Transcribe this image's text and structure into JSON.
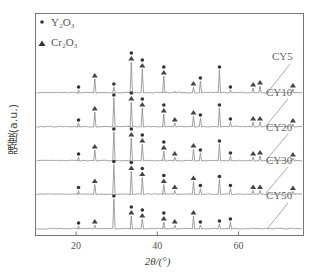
{
  "chart_data": {
    "type": "line",
    "title": "",
    "xlabel": "2θ/(°)",
    "ylabel": "强度(a.u.)",
    "xlim": [
      10,
      76
    ],
    "xticks": [
      20,
      40,
      60
    ],
    "grid": false,
    "legend": {
      "position": "top-left",
      "entries": [
        {
          "marker": "dot",
          "label": "Y2O3"
        },
        {
          "marker": "triangle",
          "label": "Cr2O3"
        }
      ]
    },
    "series": [
      {
        "name": "CY5",
        "peaks": [
          {
            "x": 20.6,
            "h": 3,
            "markers": [
              "dot"
            ]
          },
          {
            "x": 24.6,
            "h": 14,
            "markers": [
              "triangle"
            ]
          },
          {
            "x": 29.3,
            "h": 6,
            "markers": [
              "dot"
            ]
          },
          {
            "x": 33.6,
            "h": 31,
            "markers": [
              "dot",
              "triangle"
            ]
          },
          {
            "x": 36.3,
            "h": 24,
            "markers": [
              "dot",
              "triangle"
            ]
          },
          {
            "x": 41.6,
            "h": 17,
            "markers": [
              "dot",
              "triangle"
            ]
          },
          {
            "x": 44.3,
            "h": 2,
            "markers": []
          },
          {
            "x": 48.9,
            "h": 6,
            "markers": [
              "triangle"
            ]
          },
          {
            "x": 50.6,
            "h": 12,
            "markers": [
              "dot"
            ]
          },
          {
            "x": 55.3,
            "h": 23,
            "markers": [
              "dot"
            ]
          },
          {
            "x": 58.0,
            "h": 3,
            "markers": [
              "dot"
            ]
          },
          {
            "x": 63.6,
            "h": 5,
            "markers": [
              "triangle"
            ]
          },
          {
            "x": 65.3,
            "h": 7,
            "markers": [
              "triangle"
            ]
          },
          {
            "x": 73.4,
            "h": 4,
            "markers": [
              "triangle"
            ]
          }
        ]
      },
      {
        "name": "CY10",
        "peaks": [
          {
            "x": 20.6,
            "h": 4,
            "markers": [
              "dot"
            ]
          },
          {
            "x": 24.6,
            "h": 15,
            "markers": [
              "triangle"
            ]
          },
          {
            "x": 29.3,
            "h": 29,
            "markers": [
              "dot"
            ]
          },
          {
            "x": 33.6,
            "h": 25,
            "markers": [
              "dot",
              "triangle"
            ]
          },
          {
            "x": 36.3,
            "h": 19,
            "markers": [
              "dot",
              "triangle"
            ]
          },
          {
            "x": 41.6,
            "h": 13,
            "markers": [
              "dot",
              "triangle"
            ]
          },
          {
            "x": 44.3,
            "h": 4,
            "markers": [
              "triangle"
            ]
          },
          {
            "x": 48.9,
            "h": 11,
            "markers": [
              "triangle"
            ]
          },
          {
            "x": 50.6,
            "h": 9,
            "markers": [
              "dot"
            ]
          },
          {
            "x": 55.3,
            "h": 19,
            "markers": [
              "dot"
            ]
          },
          {
            "x": 58.0,
            "h": 5,
            "markers": [
              "dot"
            ]
          },
          {
            "x": 63.6,
            "h": 5,
            "markers": [
              "triangle"
            ]
          },
          {
            "x": 65.3,
            "h": 5,
            "markers": [
              "triangle"
            ]
          },
          {
            "x": 73.4,
            "h": 3,
            "markers": [
              "triangle"
            ]
          }
        ]
      },
      {
        "name": "CY20",
        "peaks": [
          {
            "x": 20.6,
            "h": 4,
            "markers": [
              "dot"
            ]
          },
          {
            "x": 24.6,
            "h": 11,
            "markers": [
              "triangle"
            ]
          },
          {
            "x": 29.3,
            "h": 29,
            "markers": [
              "dot"
            ]
          },
          {
            "x": 33.6,
            "h": 23,
            "markers": [
              "dot",
              "triangle"
            ]
          },
          {
            "x": 36.3,
            "h": 17,
            "markers": [
              "dot",
              "triangle"
            ]
          },
          {
            "x": 41.6,
            "h": 10,
            "markers": [
              "dot",
              "triangle"
            ]
          },
          {
            "x": 44.3,
            "h": 4,
            "markers": [
              "triangle"
            ]
          },
          {
            "x": 48.9,
            "h": 12,
            "markers": [
              "triangle"
            ]
          },
          {
            "x": 50.6,
            "h": 8,
            "markers": [
              "dot"
            ]
          },
          {
            "x": 55.3,
            "h": 17,
            "markers": [
              "dot"
            ]
          },
          {
            "x": 58.0,
            "h": 5,
            "markers": [
              "dot"
            ]
          },
          {
            "x": 63.6,
            "h": 4,
            "markers": [
              "triangle"
            ]
          },
          {
            "x": 65.3,
            "h": 5,
            "markers": [
              "triangle"
            ]
          },
          {
            "x": 73.4,
            "h": 3,
            "markers": [
              "triangle"
            ]
          }
        ]
      },
      {
        "name": "CY30",
        "peaks": [
          {
            "x": 20.6,
            "h": 4,
            "markers": [
              "dot"
            ]
          },
          {
            "x": 24.6,
            "h": 10,
            "markers": [
              "triangle"
            ]
          },
          {
            "x": 29.3,
            "h": 30,
            "markers": [
              "dot"
            ]
          },
          {
            "x": 33.6,
            "h": 23,
            "markers": [
              "dot",
              "triangle"
            ]
          },
          {
            "x": 36.3,
            "h": 17,
            "markers": [
              "dot",
              "triangle"
            ]
          },
          {
            "x": 41.6,
            "h": 10,
            "markers": [
              "dot",
              "triangle"
            ]
          },
          {
            "x": 44.3,
            "h": 4,
            "markers": [
              "triangle"
            ]
          },
          {
            "x": 48.9,
            "h": 13,
            "markers": [
              "triangle"
            ]
          },
          {
            "x": 50.6,
            "h": 6,
            "markers": [
              "dot"
            ]
          },
          {
            "x": 55.3,
            "h": 15,
            "markers": [
              "dot"
            ]
          },
          {
            "x": 58.0,
            "h": 6,
            "markers": [
              "dot"
            ]
          },
          {
            "x": 63.6,
            "h": 4,
            "markers": [
              "triangle"
            ]
          },
          {
            "x": 65.3,
            "h": 4,
            "markers": [
              "triangle"
            ]
          },
          {
            "x": 73.4,
            "h": 3,
            "markers": [
              "triangle"
            ]
          }
        ]
      },
      {
        "name": "CY50",
        "peaks": [
          {
            "x": 20.6,
            "h": 3,
            "markers": [
              "dot"
            ]
          },
          {
            "x": 24.6,
            "h": 4,
            "markers": [
              "triangle"
            ]
          },
          {
            "x": 29.3,
            "h": 30,
            "markers": [
              "dot"
            ]
          },
          {
            "x": 33.6,
            "h": 13,
            "markers": [
              "dot",
              "triangle"
            ]
          },
          {
            "x": 36.3,
            "h": 10,
            "markers": [
              "dot",
              "triangle"
            ]
          },
          {
            "x": 41.6,
            "h": 7,
            "markers": [
              "dot",
              "triangle"
            ]
          },
          {
            "x": 44.3,
            "h": 4,
            "markers": [
              "triangle"
            ]
          },
          {
            "x": 48.9,
            "h": 13,
            "markers": [
              "triangle"
            ]
          },
          {
            "x": 50.6,
            "h": 4,
            "markers": [
              "dot"
            ]
          },
          {
            "x": 55.3,
            "h": 5,
            "markers": [
              "dot"
            ]
          },
          {
            "x": 58.0,
            "h": 7,
            "markers": [
              "dot"
            ]
          }
        ]
      }
    ]
  },
  "labels": {
    "ylabel": "强度(a.u.)",
    "xlabel": "2θ/(°)",
    "legend_y2o3": "Y₂O₃",
    "legend_cr2o3": "Cr₂O₃"
  }
}
